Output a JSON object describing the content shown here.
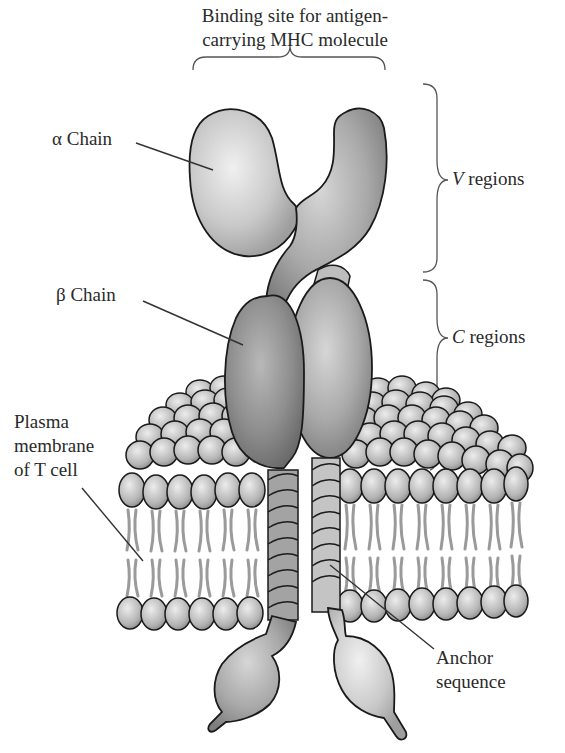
{
  "figure": {
    "labels": {
      "binding_site": {
        "line1": "Binding site for antigen-",
        "line2": "carrying MHC molecule"
      },
      "alpha_chain": {
        "greek": "α",
        "text": "Chain"
      },
      "beta_chain": {
        "greek": "β",
        "text": "Chain"
      },
      "v_regions": {
        "letter": "V",
        "text": "regions"
      },
      "c_regions": {
        "letter": "C",
        "text": "regions"
      },
      "plasma_membrane": {
        "line1": "Plasma",
        "line2": "membrane",
        "line3": "of T cell"
      },
      "anchor_sequence": {
        "line1": "Anchor",
        "line2": "sequence"
      }
    },
    "colors": {
      "background": "#ffffff",
      "outline": "#1a1a1a",
      "alpha_light": "#d9d9d9",
      "beta_dark": "#8c8c8c",
      "lipid_head": "#bdbdbd",
      "lipid_tail": "#9a9a9a",
      "text": "#2a2a2a"
    }
  }
}
